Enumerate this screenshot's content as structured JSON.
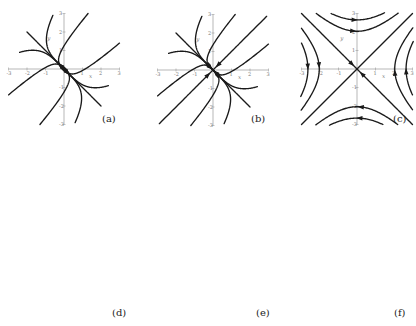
{
  "figure": {
    "panels": [
      {
        "id": "a",
        "caption": "(a)",
        "type": "node-unstable-degenerate",
        "origin": [
          64,
          69
        ],
        "scale": 18.5,
        "x_ticks": [
          "-3",
          "-2",
          "-1",
          "1",
          "2",
          "3"
        ],
        "y_ticks": [
          "3",
          "2",
          "1",
          "-1",
          "-2",
          "-3"
        ],
        "x_label": "x",
        "y_label": "y",
        "caption_pos": [
          102,
          113
        ]
      },
      {
        "id": "b",
        "caption": "(b)",
        "type": "node-stable-degenerate",
        "origin": [
          213,
          70
        ],
        "scale": 18.5,
        "x_ticks": [
          "-3",
          "-2",
          "-1",
          "1",
          "2",
          "3"
        ],
        "y_ticks": [
          "3",
          "2",
          "1",
          "-1",
          "-2",
          "-3"
        ],
        "x_label": "x",
        "y_label": "y",
        "caption_pos": [
          251,
          113
        ]
      },
      {
        "id": "c",
        "caption": "(c)",
        "type": "saddle",
        "origin": [
          357,
          69
        ],
        "scale": 18.5,
        "x_ticks": [
          "-3",
          "-2",
          "-1",
          "1",
          "2",
          "3"
        ],
        "y_ticks": [
          "3",
          "2",
          "1",
          "-1",
          "-2",
          "-3"
        ],
        "x_label": "x",
        "y_label": "y",
        "caption_pos": [
          393,
          113
        ]
      },
      {
        "id": "d",
        "caption": "(d)",
        "type": "spiral-sink",
        "origin": [
          70,
          257
        ],
        "scale": 20,
        "x_ticks": [
          "-3",
          "-2",
          "-1",
          "1",
          "2",
          "3"
        ],
        "y_ticks": [
          "3",
          "2",
          "1",
          "-1",
          "-2",
          "-3"
        ],
        "x_label": "x",
        "y_label": "y",
        "caption_pos": [
          112,
          307
        ]
      },
      {
        "id": "e",
        "caption": "(e)",
        "type": "spiral-source",
        "origin": [
          212,
          257
        ],
        "scale": 20,
        "x_ticks": [
          "-3",
          "-2",
          "-1",
          "1",
          "2",
          "3"
        ],
        "y_ticks": [
          "3",
          "2",
          "1",
          "-1",
          "-2",
          "-3"
        ],
        "x_label": "x",
        "y_label": "y",
        "caption_pos": [
          256,
          307
        ]
      },
      {
        "id": "f",
        "caption": "(f)",
        "type": "center",
        "origin": [
          349,
          258
        ],
        "scale": 20,
        "x_ticks": [
          "-3",
          "-2",
          "-1",
          "1",
          "2",
          "3"
        ],
        "y_ticks": [
          "3",
          "2",
          "1",
          "-1",
          "-2",
          "-3"
        ],
        "x_label": "x",
        "y_label": "y",
        "caption_pos": [
          394,
          307
        ]
      }
    ]
  },
  "colors": {
    "trajectory": "#1a1a1a",
    "axis": "#9a9a9a",
    "label": "#777777"
  }
}
